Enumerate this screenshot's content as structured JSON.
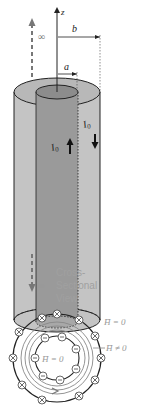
{
  "diagram": {
    "labels": {
      "z_axis": "z",
      "infinity_top": "∞",
      "infinity_bottom": "∞",
      "inner_radius": "a",
      "outer_radius": "b",
      "inner_current": "I",
      "inner_current_sub": "0",
      "outer_current": "I",
      "outer_current_sub": "0",
      "cross_section_line1": "Cross-",
      "cross_section_line2": "Sectional",
      "cross_section_line3": "View",
      "h_outside": "H̄ = 0",
      "h_between": "H̄ ≠ 0",
      "h_inside": "H̄ = 0"
    },
    "colors": {
      "outer_shell": "#c4c4c4",
      "outer_top": "#b8b8b8",
      "inner_conductor": "#9a9a9a",
      "inner_top": "#8c8c8c",
      "stroke": "#222222",
      "label_gray": "#a0a0a0",
      "field_line": "#888888"
    },
    "inner_current_direction": "up",
    "outer_current_direction": "down"
  }
}
